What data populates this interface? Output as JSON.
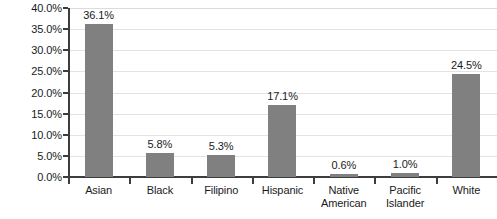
{
  "chart_data": {
    "type": "bar",
    "title": "",
    "subtitle": "",
    "xlabel": "",
    "ylabel": "",
    "categories": [
      "Asian",
      "Black",
      "Filipino",
      "Hispanic",
      "Native American",
      "Pacific Islander",
      "White"
    ],
    "values": [
      36.1,
      5.8,
      5.3,
      17.1,
      0.6,
      1.0,
      24.5
    ],
    "value_labels": [
      "36.1%",
      "5.8%",
      "5.3%",
      "17.1%",
      "0.6%",
      "1.0%",
      "24.5%"
    ],
    "category_lines": [
      [
        "Asian"
      ],
      [
        "Black"
      ],
      [
        "Filipino"
      ],
      [
        "Hispanic"
      ],
      [
        "Native",
        "American"
      ],
      [
        "Pacific",
        "Islander"
      ],
      [
        "White"
      ]
    ],
    "ylim": [
      0,
      40
    ],
    "ytick_values": [
      0,
      5,
      10,
      15,
      20,
      25,
      30,
      35,
      40
    ],
    "ytick_labels": [
      "0.0%",
      "5.0%",
      "10.0%",
      "15.0%",
      "20.0%",
      "25.0%",
      "30.0%",
      "35.0%",
      "40.0%"
    ],
    "grid": "horizontal",
    "legend": "none",
    "colors": {
      "bar": "#808080",
      "axis": "#3d3d3d",
      "gridline": "#e3e3e3",
      "text": "#1a1a1a",
      "background": "#ffffff"
    }
  }
}
